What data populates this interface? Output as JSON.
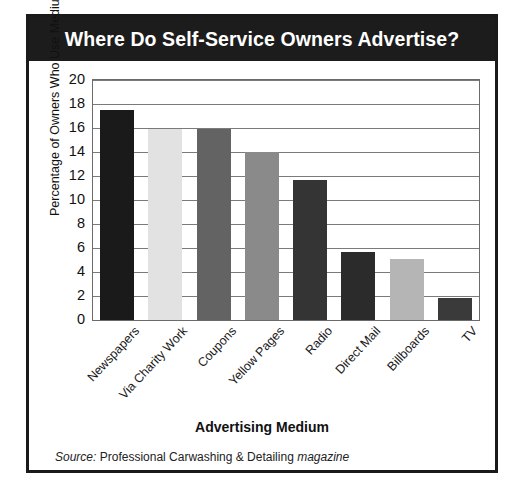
{
  "figure": {
    "title": "Where Do Self-Service Owners Advertise?"
  },
  "source": {
    "label": "Source:",
    "publication": "Professional Carwashing & Detailing",
    "suffix": "magazine"
  },
  "chart_data": {
    "type": "bar",
    "title": "Where Do Self-Service Owners Advertise?",
    "xlabel": "Advertising Medium",
    "ylabel": "Percentage of Owners Who Use Medium",
    "categories": [
      "Newspapers",
      "Via Charity Work",
      "Coupons",
      "Yellow Pages",
      "Radio",
      "Direct Mail",
      "Billboards",
      "TV"
    ],
    "values": [
      17.5,
      15.9,
      15.9,
      14.0,
      11.7,
      5.7,
      5.1,
      1.8
    ],
    "bar_colors": [
      "#1a1a1a",
      "#e2e2e2",
      "#636363",
      "#8a8a8a",
      "#343434",
      "#2b2b2b",
      "#b5b5b5",
      "#3a3a3a"
    ],
    "ylim": [
      0,
      20
    ],
    "yticks": [
      0,
      2,
      4,
      6,
      8,
      10,
      12,
      14,
      16,
      18,
      20
    ],
    "ytick_labels": [
      "0",
      "2",
      "4",
      "6",
      "8",
      "10",
      "12",
      "14",
      "16",
      "18",
      "20"
    ],
    "grid": true,
    "legend": false
  },
  "colors": {
    "title_bar_bg": "#1c1c1c",
    "title_text": "#ffffff",
    "frame_border": "#1a1a1a",
    "axis_line": "#6b6b6b",
    "gridline": "#7a7a7a"
  }
}
